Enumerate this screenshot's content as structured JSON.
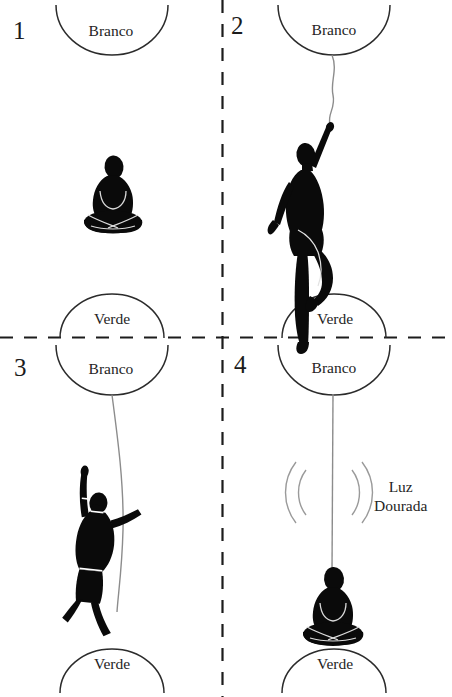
{
  "figure": {
    "layout": "2x2 grid of panels separated by dashed lines",
    "background_color": "#ffffff",
    "ink_color": "#0a0a0a",
    "arc_stroke_color": "#2b2b2b",
    "cord_color": "#8c8c8c",
    "divider_color": "#1c1c1c"
  },
  "labels": {
    "branco": "Branco",
    "verde": "Verde",
    "luz_dourada_line1": "Luz",
    "luz_dourada_line2": "Dourada",
    "luz_dourada": "Luz Dourada"
  },
  "panels": [
    {
      "number": "1",
      "top_arc_label": "Branco",
      "bottom_arc_label": "Verde",
      "figure_pose": "seated-lotus-meditating",
      "has_cord": false,
      "has_waves": false
    },
    {
      "number": "2",
      "top_arc_label": "Branco",
      "bottom_arc_label": "Verde",
      "figure_pose": "standing-arm-raised-grasping-cord",
      "has_cord": true,
      "has_waves": false
    },
    {
      "number": "3",
      "top_arc_label": "Branco",
      "bottom_arc_label": "Verde",
      "figure_pose": "inverted-descending-head-down",
      "has_cord": true,
      "has_waves": false
    },
    {
      "number": "4",
      "top_arc_label": "Branco",
      "bottom_arc_label": "Verde",
      "figure_pose": "seated-lotus-meditating",
      "has_cord": true,
      "has_waves": true,
      "wave_label_line1": "Luz",
      "wave_label_line2": "Dourada"
    }
  ]
}
